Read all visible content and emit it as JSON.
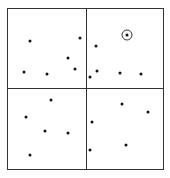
{
  "diagram": {
    "type": "quadtree-point-partition",
    "frame": {
      "x": 7,
      "y": 8,
      "width": 156,
      "height": 161
    },
    "dividers": {
      "vertical_x": 86,
      "horizontal_y": 88
    },
    "colors": {
      "stroke": "#333333",
      "point": "#111111",
      "background": "#ffffff"
    },
    "points": [
      {
        "x": 30,
        "y": 41
      },
      {
        "x": 80,
        "y": 38
      },
      {
        "x": 68,
        "y": 58
      },
      {
        "x": 75,
        "y": 69
      },
      {
        "x": 24,
        "y": 72
      },
      {
        "x": 47,
        "y": 74
      },
      {
        "x": 127,
        "y": 35,
        "highlighted": true
      },
      {
        "x": 96,
        "y": 46
      },
      {
        "x": 97,
        "y": 71
      },
      {
        "x": 90,
        "y": 77
      },
      {
        "x": 120,
        "y": 73
      },
      {
        "x": 141,
        "y": 74
      },
      {
        "x": 51,
        "y": 100
      },
      {
        "x": 26,
        "y": 117
      },
      {
        "x": 45,
        "y": 131
      },
      {
        "x": 68,
        "y": 133
      },
      {
        "x": 30,
        "y": 155
      },
      {
        "x": 122,
        "y": 104
      },
      {
        "x": 148,
        "y": 112
      },
      {
        "x": 92,
        "y": 122
      },
      {
        "x": 126,
        "y": 145
      },
      {
        "x": 90,
        "y": 150
      }
    ]
  }
}
